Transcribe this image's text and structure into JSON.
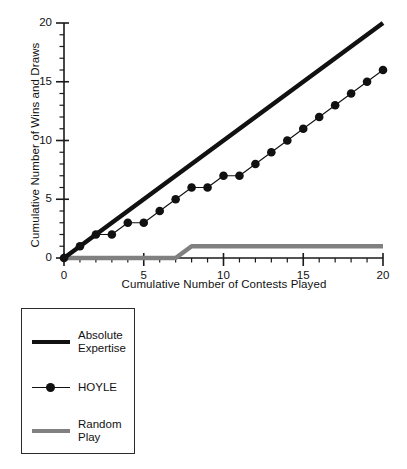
{
  "chart_data": {
    "type": "line",
    "title": "",
    "xlabel": "Cumulative Number of Contests Played",
    "ylabel": "Cumulative Number of Wins and Draws",
    "xlim": [
      0,
      20
    ],
    "ylim": [
      0,
      20
    ],
    "xticks": [
      0,
      5,
      10,
      15,
      20
    ],
    "yticks": [
      0,
      5,
      10,
      15,
      20
    ],
    "xtick_labels": [
      "0",
      "5",
      "10",
      "15",
      "20"
    ],
    "ytick_labels": [
      "0",
      "5",
      "10",
      "15",
      "20"
    ],
    "minor_tick_step": 1,
    "grid": false,
    "legend_position": "below-left",
    "x": [
      0,
      1,
      2,
      3,
      4,
      5,
      6,
      7,
      8,
      9,
      10,
      11,
      12,
      13,
      14,
      15,
      16,
      17,
      18,
      19,
      20
    ],
    "series": [
      {
        "name": "Absolute Expertise",
        "label": "Absolute\nExpertise",
        "style": "thick-line",
        "color": "#111111",
        "marker": "none",
        "values": [
          0,
          1,
          2,
          3,
          4,
          5,
          6,
          7,
          8,
          9,
          10,
          11,
          12,
          13,
          14,
          15,
          16,
          17,
          18,
          19,
          20
        ]
      },
      {
        "name": "HOYLE",
        "label": "HOYLE",
        "style": "thin-line-markers",
        "color": "#111111",
        "marker": "circle",
        "values": [
          0,
          1,
          2,
          2,
          3,
          3,
          4,
          5,
          6,
          6,
          7,
          7,
          8,
          9,
          10,
          11,
          12,
          13,
          14,
          15,
          16
        ]
      },
      {
        "name": "Random Play",
        "label": "Random\nPlay",
        "style": "thick-line",
        "color": "#808080",
        "marker": "none",
        "values": [
          0,
          0,
          0,
          0,
          0,
          0,
          0,
          0,
          1,
          1,
          1,
          1,
          1,
          1,
          1,
          1,
          1,
          1,
          1,
          1,
          1
        ]
      }
    ]
  },
  "axes": {
    "y_title": "Cumulative Number of Wins and Draws",
    "x_title": "Cumulative Number of Contests Played",
    "y_tick_labels": [
      "20",
      "15",
      "10",
      "5",
      "0"
    ],
    "x_tick_labels": [
      "0",
      "5",
      "10",
      "15",
      "20"
    ]
  },
  "legend": {
    "entries": [
      {
        "label": "Absolute\nExpertise",
        "key": "thick-black-line-key"
      },
      {
        "label": "HOYLE",
        "key": "line-with-dot-marker-key"
      },
      {
        "label": "Random\nPlay",
        "key": "thick-gray-line-key"
      }
    ]
  },
  "colors": {
    "series_primary": "#111111",
    "series_random": "#808080",
    "axis": "#1a1a1a",
    "background": "#ffffff"
  }
}
